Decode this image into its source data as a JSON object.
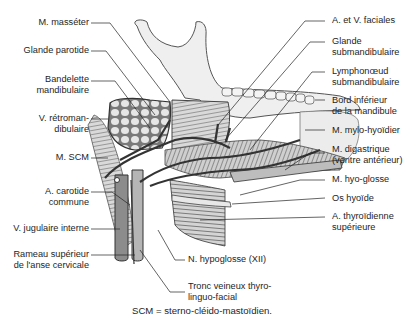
{
  "figure": {
    "caption": "SCM = sterno-cléido-mastoïdien.",
    "labels_left": [
      {
        "id": "masseter",
        "lines": [
          "M. masséter"
        ]
      },
      {
        "id": "parotide",
        "lines": [
          "Glande parotide"
        ]
      },
      {
        "id": "bandelette",
        "lines": [
          "Bandelette",
          "mandibulaire"
        ]
      },
      {
        "id": "retromandibulaire",
        "lines": [
          "V. rétroman-",
          "dibulaire"
        ]
      },
      {
        "id": "scm",
        "lines": [
          "M. SCM"
        ]
      },
      {
        "id": "carotide",
        "lines": [
          "A. carotide",
          "commune"
        ]
      },
      {
        "id": "jugulaire",
        "lines": [
          "V. jugulaire interne"
        ]
      },
      {
        "id": "rameau",
        "lines": [
          "Rameau supérieur",
          "de l'anse cervicale"
        ]
      }
    ],
    "labels_right": [
      {
        "id": "faciales",
        "lines": [
          "A. et V. faciales"
        ]
      },
      {
        "id": "submandibulaire",
        "lines": [
          "Glande",
          "submandibulaire"
        ]
      },
      {
        "id": "lymphonoeud",
        "lines": [
          "Lymphonœud",
          "submandibulaire"
        ]
      },
      {
        "id": "bord",
        "lines": [
          "Bord inférieur",
          "de la mandibule"
        ]
      },
      {
        "id": "mylohyoidien",
        "lines": [
          "M. mylo-hyoïdier"
        ]
      },
      {
        "id": "digastrique",
        "lines": [
          "M. digastrique",
          "(ventre antérieur)"
        ]
      },
      {
        "id": "hyoglosse",
        "lines": [
          "M. hyo-glosse"
        ]
      },
      {
        "id": "hyoide",
        "lines": [
          "Os hyoïde"
        ]
      },
      {
        "id": "thyroidienne",
        "lines": [
          "A. thyroïdienne",
          "supérieure"
        ]
      }
    ],
    "labels_bottom": [
      {
        "id": "hypoglosse",
        "lines": [
          "N. hypoglosse (XII)"
        ]
      },
      {
        "id": "tronc",
        "lines": [
          "Tronc veineux thyro-",
          "linguo-facial"
        ]
      }
    ]
  }
}
